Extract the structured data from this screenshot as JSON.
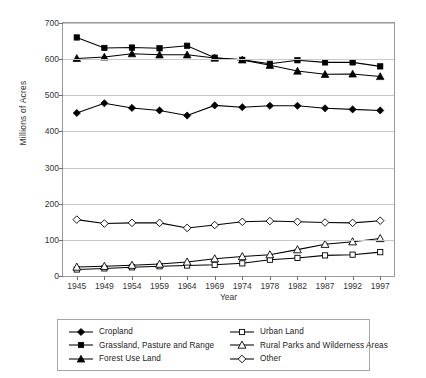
{
  "chart_data": {
    "type": "line",
    "title": "",
    "xlabel": "Year",
    "ylabel": "Millions of Acres",
    "categories": [
      "1945",
      "1949",
      "1954",
      "1959",
      "1964",
      "1969",
      "1974",
      "1978",
      "1982",
      "1987",
      "1992",
      "1997"
    ],
    "ylim": [
      0,
      700
    ],
    "ytick_values": [
      0,
      100,
      200,
      300,
      400,
      500,
      600,
      700
    ],
    "ytick_labels": [
      "0",
      "100",
      "200",
      "300",
      "400",
      "500",
      "600",
      "700"
    ],
    "grid": true,
    "legend_position": "below-plot",
    "series": [
      {
        "name": "Cropland",
        "marker": "filled-diamond",
        "values": [
          451,
          478,
          465,
          458,
          444,
          472,
          467,
          471,
          471,
          464,
          461,
          458
        ]
      },
      {
        "name": "Grassland, Pasture and Range",
        "marker": "filled-square",
        "values": [
          660,
          631,
          632,
          630,
          637,
          604,
          598,
          587,
          597,
          591,
          591,
          580
        ]
      },
      {
        "name": "Forest Use Land",
        "marker": "filled-triangle",
        "values": [
          602,
          606,
          615,
          612,
          612,
          603,
          598,
          583,
          567,
          558,
          559,
          552
        ]
      },
      {
        "name": "Urban Land",
        "marker": "open-square",
        "values": [
          18,
          21,
          24,
          27,
          29,
          31,
          35,
          45,
          50,
          57,
          59,
          66
        ]
      },
      {
        "name": "Rural Parks and Wilderness Areas",
        "marker": "open-triangle",
        "values": [
          25,
          27,
          30,
          33,
          39,
          48,
          54,
          59,
          73,
          88,
          95,
          104
        ]
      },
      {
        "name": "Other",
        "marker": "open-diamond",
        "values": [
          156,
          145,
          147,
          147,
          133,
          141,
          150,
          152,
          150,
          148,
          147,
          153
        ]
      }
    ]
  },
  "legend": {
    "left_items": [
      "Cropland",
      "Grassland, Pasture and Range",
      "Forest Use Land"
    ],
    "right_items": [
      "Urban Land",
      "Rural Parks and Wilderness Areas",
      "Other"
    ]
  },
  "colors": {
    "line": "#000000",
    "grid": "#c9c9c9",
    "axis": "#8a8a8a",
    "text": "#1a1a1a",
    "background": "#ffffff"
  }
}
